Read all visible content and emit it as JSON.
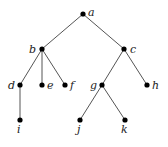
{
  "diagram": {
    "type": "rooted-tree",
    "nodes": [
      {
        "id": "a",
        "label": "a",
        "x": 83,
        "y": 14,
        "lx": 88,
        "ly": 16
      },
      {
        "id": "b",
        "label": "b",
        "x": 42,
        "y": 49,
        "lx": 29,
        "ly": 53
      },
      {
        "id": "c",
        "label": "c",
        "x": 124,
        "y": 49,
        "lx": 130,
        "ly": 53
      },
      {
        "id": "d",
        "label": "d",
        "x": 20,
        "y": 85,
        "lx": 8,
        "ly": 89
      },
      {
        "id": "e",
        "label": "e",
        "x": 42,
        "y": 85,
        "lx": 47,
        "ly": 89
      },
      {
        "id": "f",
        "label": "f",
        "x": 65,
        "y": 85,
        "lx": 70,
        "ly": 89
      },
      {
        "id": "g",
        "label": "g",
        "x": 102,
        "y": 85,
        "lx": 90,
        "ly": 89
      },
      {
        "id": "h",
        "label": "h",
        "x": 147,
        "y": 85,
        "lx": 152,
        "ly": 89
      },
      {
        "id": "i",
        "label": "i",
        "x": 20,
        "y": 120,
        "lx": 17,
        "ly": 133
      },
      {
        "id": "j",
        "label": "j",
        "x": 80,
        "y": 120,
        "lx": 77,
        "ly": 133
      },
      {
        "id": "k",
        "label": "k",
        "x": 125,
        "y": 120,
        "lx": 121,
        "ly": 133
      }
    ],
    "edges": [
      [
        "a",
        "b"
      ],
      [
        "a",
        "c"
      ],
      [
        "b",
        "d"
      ],
      [
        "b",
        "e"
      ],
      [
        "b",
        "f"
      ],
      [
        "c",
        "g"
      ],
      [
        "c",
        "h"
      ],
      [
        "d",
        "i"
      ],
      [
        "g",
        "j"
      ],
      [
        "g",
        "k"
      ]
    ]
  }
}
